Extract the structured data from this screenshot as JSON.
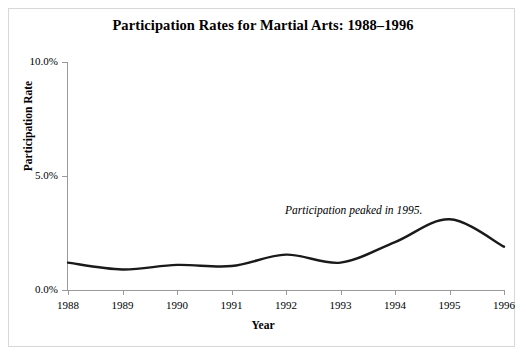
{
  "chart_data": {
    "type": "line",
    "title": "Participation Rates for Martial Arts: 1988–1996",
    "xlabel": "Year",
    "ylabel": "Participation Rate",
    "categories": [
      "1988",
      "1989",
      "1990",
      "1991",
      "1992",
      "1993",
      "1994",
      "1995",
      "1996"
    ],
    "x": [
      1988,
      1989,
      1990,
      1991,
      1992,
      1993,
      1994,
      1995,
      1996
    ],
    "values": [
      1.2,
      0.9,
      1.1,
      1.05,
      1.55,
      1.2,
      2.1,
      3.1,
      1.9
    ],
    "series": [
      {
        "name": "Participation Rate",
        "values": [
          1.2,
          0.9,
          1.1,
          1.05,
          1.55,
          1.2,
          2.1,
          3.1,
          1.9
        ]
      }
    ],
    "xlim": [
      1988,
      1996
    ],
    "ylim": [
      0.0,
      10.0
    ],
    "ytick_values": [
      0.0,
      5.0,
      10.0
    ],
    "ytick_labels": [
      "0.0%",
      "5.0%",
      "10.0%"
    ],
    "xtick_labels": [
      "1988",
      "1989",
      "1990",
      "1991",
      "1992",
      "1993",
      "1994",
      "1995",
      "1996"
    ],
    "grid": false,
    "legend": false,
    "legend_position": "none",
    "annotations": [
      {
        "text": "Participation peaked in 1995.",
        "x": 1992.0,
        "y": 3.7,
        "style": "italic"
      }
    ],
    "line_color": "#1a1a1a",
    "line_width": 2.4,
    "axis_color": "#9a9a9a",
    "background_color": "#ffffff",
    "frame_color": "#d8d8d8",
    "smoothing": "spline"
  },
  "yticks": [
    {
      "label": "10.0%",
      "value": 10.0,
      "top": 62
    },
    {
      "label": "5.0%",
      "value": 5.0,
      "top": 176
    },
    {
      "label": "0.0%",
      "value": 0.0,
      "top": 290
    }
  ],
  "xticks": [
    {
      "label": "1988",
      "left": 68
    },
    {
      "label": "1989",
      "left": 122.5
    },
    {
      "label": "1990",
      "left": 177
    },
    {
      "label": "1991",
      "left": 231.5
    },
    {
      "label": "1992",
      "left": 286
    },
    {
      "label": "1993",
      "left": 340.5
    },
    {
      "label": "1994",
      "left": 395
    },
    {
      "label": "1995",
      "left": 449.5
    },
    {
      "label": "1996",
      "left": 504
    }
  ]
}
